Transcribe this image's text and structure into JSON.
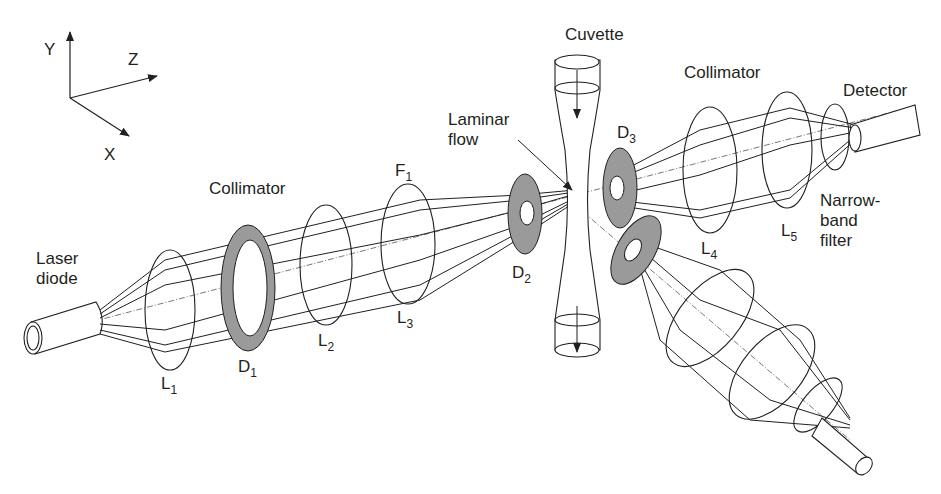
{
  "diagram": {
    "axes": {
      "y": "Y",
      "z": "Z",
      "x": "X"
    },
    "labels": {
      "laser_diode": [
        "Laser",
        "diode"
      ],
      "collimator_1": "Collimator",
      "collimator_2": "Collimator",
      "cuvette": "Cuvette",
      "laminar_flow": [
        "Laminar",
        "flow"
      ],
      "detector": "Detector",
      "narrow_band_filter": [
        "Narrow-",
        "band",
        "filter"
      ]
    },
    "components": {
      "L1": {
        "main": "L",
        "sub": "1"
      },
      "L2": {
        "main": "L",
        "sub": "2"
      },
      "L3": {
        "main": "L",
        "sub": "3"
      },
      "L4": {
        "main": "L",
        "sub": "4"
      },
      "L5": {
        "main": "L",
        "sub": "5"
      },
      "D1": {
        "main": "D",
        "sub": "1"
      },
      "D2": {
        "main": "D",
        "sub": "2"
      },
      "D3": {
        "main": "D",
        "sub": "3"
      },
      "F1": {
        "main": "F",
        "sub": "1"
      }
    },
    "colors": {
      "line": "#231f20",
      "diaphragm": "#9a9a9a",
      "background": "#ffffff"
    }
  }
}
